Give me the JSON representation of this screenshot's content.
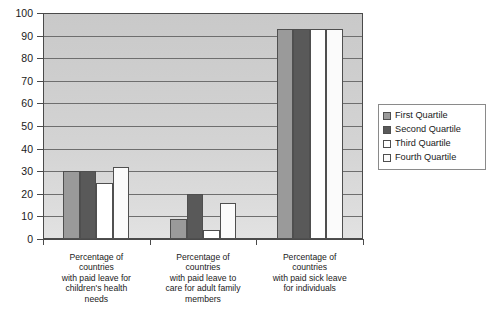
{
  "chart_data": {
    "type": "bar",
    "title": "",
    "xlabel": "",
    "ylabel": "",
    "ylim": [
      0,
      100
    ],
    "yticks": [
      0,
      10,
      20,
      30,
      40,
      50,
      60,
      70,
      80,
      90,
      100
    ],
    "grid": true,
    "legend_position": "right",
    "categories": [
      "Percentage of countries with paid leave for children's health needs",
      "Percentage of countries with paid leave to care for adult family members",
      "Percentage of countries with paid sick leave for individuals"
    ],
    "category_lines": [
      [
        "Percentage of",
        "countries",
        "with paid leave for",
        "children's health",
        "needs"
      ],
      [
        "Percentage of",
        "countries",
        "with paid leave to",
        "care for adult family",
        "members"
      ],
      [
        "Percentage of",
        "countries",
        "with paid sick leave",
        "for individuals"
      ]
    ],
    "series": [
      {
        "name": "First Quartile",
        "color": "#9a9a9a",
        "values": [
          30,
          9,
          93
        ]
      },
      {
        "name": "Second Quartile",
        "color": "#595959",
        "values": [
          30,
          20,
          93
        ]
      },
      {
        "name": "Third Quartile",
        "color": "#ffffff",
        "values": [
          25,
          4,
          93
        ]
      },
      {
        "name": "Fourth Quartile",
        "color": "#fbfbfb",
        "values": [
          32,
          16,
          93
        ]
      }
    ]
  },
  "legend": {
    "items": [
      {
        "label": "First Quartile"
      },
      {
        "label": "Second Quartile"
      },
      {
        "label": "Third Quartile"
      },
      {
        "label": "Fourth Quartile"
      }
    ]
  }
}
